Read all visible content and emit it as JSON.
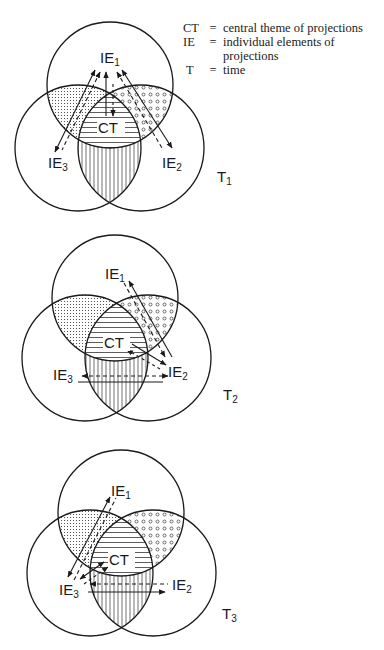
{
  "legend": [
    {
      "key": "CT",
      "eq": "=",
      "value": "central theme of projections"
    },
    {
      "key": "IE",
      "eq": "=",
      "value": "individual elements of projections"
    },
    {
      "key": "T",
      "eq": "=",
      "value": "time"
    }
  ],
  "labels": {
    "ie": "IE",
    "ct": "CT",
    "t": "T",
    "sub1": "1",
    "sub2": "2",
    "sub3": "3"
  },
  "diagrams": [
    {
      "id": "T1",
      "label": "T",
      "subscript": "1"
    },
    {
      "id": "T2",
      "label": "T",
      "subscript": "2"
    },
    {
      "id": "T3",
      "label": "T",
      "subscript": "3"
    }
  ],
  "colors": {
    "stroke": "#1a1a1a",
    "background": "#ffffff"
  }
}
